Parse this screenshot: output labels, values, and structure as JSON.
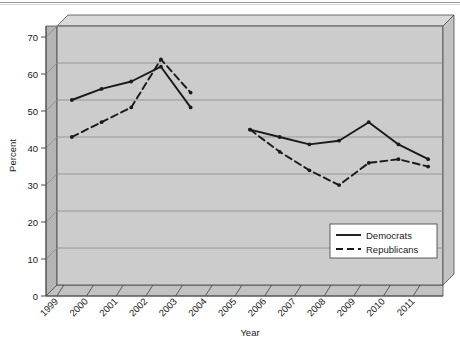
{
  "chart_data": {
    "type": "line",
    "title": "",
    "xlabel": "Year",
    "ylabel": "Percent",
    "categories": [
      "1999",
      "2000",
      "2001",
      "2002",
      "2003",
      "2004",
      "2005",
      "2006",
      "2007",
      "2008",
      "2009",
      "2010",
      "2011"
    ],
    "ylim": [
      0,
      70
    ],
    "ytick_step": 10,
    "yticks": [
      "0",
      "10",
      "20",
      "30",
      "40",
      "50",
      "60",
      "70"
    ],
    "grid": true,
    "legend_position": "bottom-right",
    "style": "3d-beveled-plot-area",
    "series": [
      {
        "name": "Democrats",
        "line_style": "solid",
        "color": "#1a1a1a",
        "values": [
          50,
          53,
          55,
          59,
          48,
          null,
          42,
          40,
          38,
          39,
          44,
          38,
          34
        ]
      },
      {
        "name": "Republicans",
        "line_style": "dashed",
        "color": "#1a1a1a",
        "values": [
          40,
          44,
          48,
          61,
          52,
          null,
          42,
          36,
          31,
          27,
          33,
          34,
          32
        ]
      }
    ]
  },
  "colors": {
    "plot_background": "#cccccc",
    "plot_bevel_top": "#d9d9d9",
    "plot_bevel_left": "#b4b4b4",
    "gridline": "#8c8c8c",
    "axis": "#4d4d4d",
    "series": "#1a1a1a",
    "legend_background": "#ffffff",
    "legend_border": "#4d4d4d",
    "page_background": "#ffffff"
  },
  "legend": {
    "items": [
      {
        "label": "Democrats",
        "style": "solid"
      },
      {
        "label": "Republicans",
        "style": "dashed"
      }
    ]
  }
}
